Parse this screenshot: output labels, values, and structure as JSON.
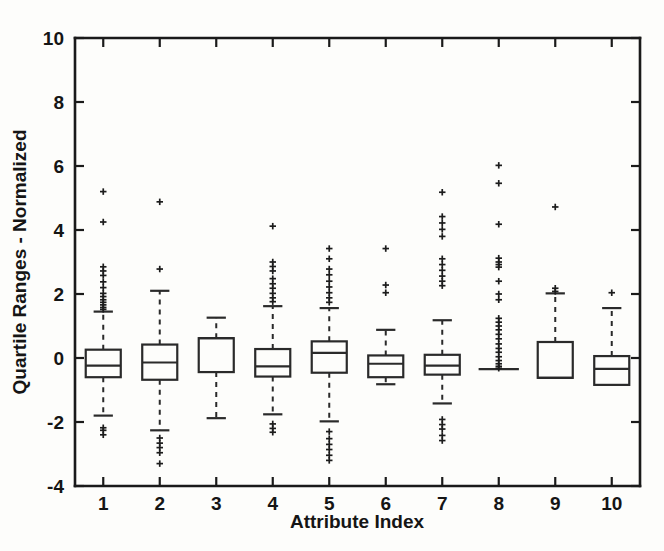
{
  "chart_data": {
    "type": "box",
    "title": "",
    "xlabel": "Attribute Index",
    "ylabel": "Quartile Ranges - Normalized",
    "categories": [
      "1",
      "2",
      "3",
      "4",
      "5",
      "6",
      "7",
      "8",
      "9",
      "10"
    ],
    "xlim": [
      0.5,
      10.5
    ],
    "ylim": [
      -4,
      10
    ],
    "yticks": [
      -4,
      -2,
      0,
      2,
      4,
      6,
      8,
      10
    ],
    "yticklabels": [
      "-4",
      "-2",
      "0",
      "2",
      "4",
      "6",
      "8",
      "10"
    ],
    "xticks": [
      1,
      2,
      3,
      4,
      5,
      6,
      7,
      8,
      9,
      10
    ],
    "xticklabels": [
      "1",
      "2",
      "3",
      "4",
      "5",
      "6",
      "7",
      "8",
      "9",
      "10"
    ],
    "grid": false,
    "legend": null,
    "box_width": 0.62,
    "outlier_marker": "plus",
    "boxes": [
      {
        "index": 1,
        "q1": -0.6,
        "median": -0.24,
        "q3": 0.26,
        "whisker_low": -1.8,
        "whisker_high": 1.45,
        "outliers": [
          5.2,
          4.25,
          2.85,
          2.72,
          2.58,
          2.38,
          2.2,
          2.02,
          1.92,
          1.82,
          1.74,
          1.66,
          1.58,
          1.52,
          -2.18,
          -2.26,
          -2.4
        ]
      },
      {
        "index": 2,
        "q1": -0.68,
        "median": -0.14,
        "q3": 0.42,
        "whisker_low": -2.26,
        "whisker_high": 2.1,
        "outliers": [
          4.88,
          2.78,
          -2.5,
          -2.66,
          -2.8,
          -2.96,
          -3.3
        ]
      },
      {
        "index": 3,
        "q1": -0.44,
        "median": 0.62,
        "q3": 0.62,
        "whisker_low": -1.88,
        "whisker_high": 1.26,
        "outliers": []
      },
      {
        "index": 4,
        "q1": -0.58,
        "median": -0.26,
        "q3": 0.28,
        "whisker_low": -1.76,
        "whisker_high": 1.62,
        "outliers": [
          4.12,
          3.0,
          2.86,
          2.72,
          2.48,
          2.32,
          2.18,
          2.02,
          1.88,
          1.76,
          -2.06,
          -2.2,
          -2.32
        ]
      },
      {
        "index": 5,
        "q1": -0.46,
        "median": 0.16,
        "q3": 0.52,
        "whisker_low": -1.98,
        "whisker_high": 1.56,
        "outliers": [
          3.42,
          3.1,
          2.78,
          2.6,
          2.4,
          2.22,
          2.04,
          1.88,
          1.74,
          -2.3,
          -2.52,
          -2.7,
          -2.86,
          -3.04,
          -3.2
        ]
      },
      {
        "index": 6,
        "q1": -0.6,
        "median": -0.18,
        "q3": 0.08,
        "whisker_low": -0.82,
        "whisker_high": 0.88,
        "outliers": [
          3.42,
          2.28,
          2.04
        ]
      },
      {
        "index": 7,
        "q1": -0.52,
        "median": -0.24,
        "q3": 0.1,
        "whisker_low": -1.42,
        "whisker_high": 1.18,
        "outliers": [
          5.18,
          4.42,
          4.22,
          4.02,
          3.8,
          3.1,
          2.92,
          2.74,
          2.56,
          2.4,
          2.26,
          -1.92,
          -2.08,
          -2.22,
          -2.42,
          -2.58
        ]
      },
      {
        "index": 8,
        "q1": -0.35,
        "median": -0.35,
        "q3": -0.35,
        "whisker_low": -0.35,
        "whisker_high": -0.35,
        "outliers": [
          6.02,
          5.46,
          4.18,
          3.12,
          3.0,
          2.92,
          2.84,
          2.4,
          2.0,
          1.82,
          1.24,
          1.12,
          1.0,
          0.88,
          0.74,
          0.6,
          0.44,
          0.3,
          0.18,
          0.04,
          -0.08,
          -0.18,
          -0.26,
          -0.32
        ]
      },
      {
        "index": 9,
        "q1": -0.62,
        "median": -0.62,
        "q3": 0.5,
        "whisker_low": -0.62,
        "whisker_high": 2.02,
        "outliers": [
          4.72,
          2.18,
          2.08
        ]
      },
      {
        "index": 10,
        "q1": -0.84,
        "median": -0.34,
        "q3": 0.06,
        "whisker_low": -0.84,
        "whisker_high": 1.56,
        "outliers": [
          2.04
        ]
      }
    ]
  },
  "axes": {
    "x_title": "Attribute Index",
    "y_title": "Quartile Ranges - Normalized"
  },
  "colors": {
    "background": "#fdfdfb",
    "axis": "#1a1a1a",
    "box_stroke": "#2a2a2a",
    "outlier": "#1c1c1c"
  }
}
